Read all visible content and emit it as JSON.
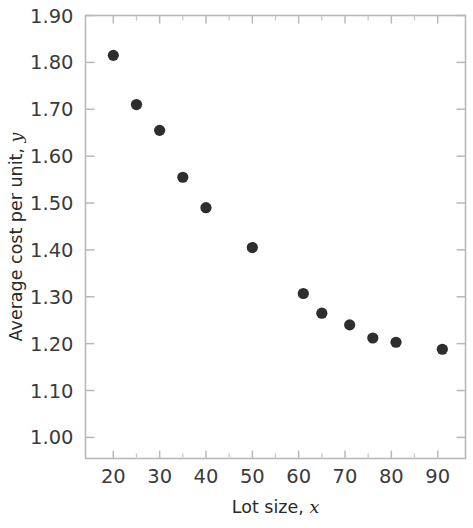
{
  "chart_data": {
    "type": "scatter",
    "title": "",
    "xlabel": "Lot size, x",
    "xlabel_main": "Lot size,",
    "xlabel_var": "x",
    "ylabel": "Average cost per unit, y",
    "ylabel_main": "Average cost per unit,",
    "ylabel_var": "y",
    "xlim": [
      14,
      96
    ],
    "ylim": [
      0.955,
      1.9
    ],
    "grid": false,
    "legend": null,
    "marker_color": "#2e2e2e",
    "axis_color": "#b9b9b9",
    "text_color": "#3b3b3b",
    "background": "#ffffff",
    "x_ticks": [
      20,
      30,
      40,
      50,
      60,
      70,
      80,
      90
    ],
    "x_tick_labels": [
      "20",
      "30",
      "40",
      "50",
      "60",
      "70",
      "80",
      "90"
    ],
    "x_minor_ticks": [
      25,
      35,
      45,
      55,
      65,
      75,
      85
    ],
    "y_ticks": [
      1.0,
      1.1,
      1.2,
      1.3,
      1.4,
      1.5,
      1.6,
      1.7,
      1.8,
      1.9
    ],
    "y_tick_labels": [
      "1.00",
      "1.10",
      "1.20",
      "1.30",
      "1.40",
      "1.50",
      "1.60",
      "1.70",
      "1.80",
      "1.90"
    ],
    "points": [
      {
        "x": 20,
        "y": 1.815
      },
      {
        "x": 25,
        "y": 1.71
      },
      {
        "x": 30,
        "y": 1.655
      },
      {
        "x": 35,
        "y": 1.555
      },
      {
        "x": 40,
        "y": 1.49
      },
      {
        "x": 50,
        "y": 1.405
      },
      {
        "x": 61,
        "y": 1.307
      },
      {
        "x": 65,
        "y": 1.265
      },
      {
        "x": 71,
        "y": 1.24
      },
      {
        "x": 76,
        "y": 1.212
      },
      {
        "x": 81,
        "y": 1.203
      },
      {
        "x": 91,
        "y": 1.188
      }
    ],
    "x": [
      20,
      25,
      30,
      35,
      40,
      50,
      61,
      65,
      71,
      76,
      81,
      91
    ],
    "values": [
      1.815,
      1.71,
      1.655,
      1.555,
      1.49,
      1.405,
      1.307,
      1.265,
      1.24,
      1.212,
      1.203,
      1.188
    ]
  }
}
